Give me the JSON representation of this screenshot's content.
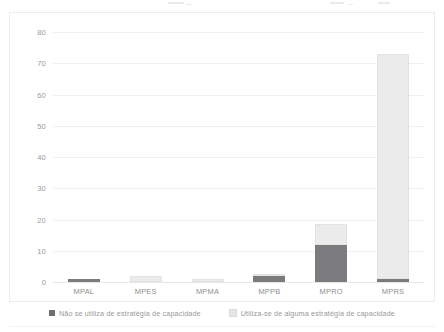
{
  "chart_data": {
    "type": "bar",
    "subtype": "stacked-column",
    "title": "",
    "xlabel": "",
    "ylabel": "",
    "categories": [
      "MPAL",
      "MPES",
      "MPMA",
      "MPPB",
      "MPRO",
      "MPRS"
    ],
    "series": [
      {
        "name": "Não se utiliza de estratégia de capacidade",
        "color": "#7b7b7d",
        "values": [
          1,
          0,
          0,
          2,
          12,
          1
        ]
      },
      {
        "name": "Utiliza-se de alguma estratégia de capacidade",
        "color": "#ebebec",
        "values": [
          0,
          2,
          1,
          0.5,
          6.5,
          72
        ]
      }
    ],
    "totals": [
      1,
      2,
      1,
      2.5,
      18.5,
      73
    ],
    "ylim": [
      0,
      80
    ],
    "yticks": [
      0,
      10,
      20,
      30,
      40,
      50,
      60,
      70,
      80
    ],
    "ytick_labels": [
      "0",
      "10",
      "20",
      "30",
      "40",
      "50",
      "60",
      "70",
      "80"
    ],
    "grid": true,
    "grid_axis": "y",
    "legend_position": "bottom"
  },
  "legend": {
    "items": [
      {
        "label": "Não se utiliza de estratégia de capacidade",
        "swatch": "dark"
      },
      {
        "label": "Utiliza-se de alguma estratégia de capacidade",
        "swatch": "light"
      }
    ]
  },
  "colors": {
    "series_dark": "#7b7b7d",
    "series_light": "#ebebec",
    "gridline": "#f0f0f1",
    "axis_text": "#9a9a9e",
    "card_border": "#ececed"
  }
}
